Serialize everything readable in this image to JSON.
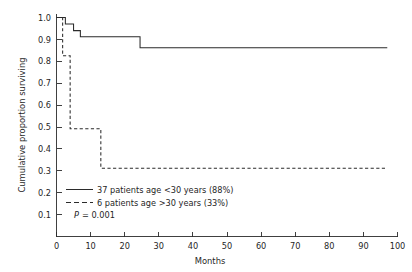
{
  "chart_data": {
    "type": "line",
    "subtype": "kaplan-meier-step",
    "title": "",
    "xlabel": "Months",
    "ylabel": "Cumulative proportion surviving",
    "xlim": [
      0,
      100
    ],
    "ylim": [
      0,
      1.0
    ],
    "grid": false,
    "legend_position": "inside lower-left",
    "x_ticks": [
      0,
      10,
      20,
      30,
      40,
      50,
      60,
      70,
      80,
      90,
      100
    ],
    "x_tick_labels": [
      "0",
      "10",
      "20",
      "30",
      "40",
      "50",
      "60",
      "70",
      "80",
      "90",
      "100"
    ],
    "y_ticks": [
      0.1,
      0.2,
      0.3,
      0.4,
      0.5,
      0.6,
      0.7,
      0.8,
      0.9,
      1.0
    ],
    "y_tick_labels": [
      "0.1",
      "0.2",
      "0.3",
      "0.4",
      "0.5",
      "0.6",
      "0.7",
      "0.8",
      "0.9",
      "1.0"
    ],
    "annotations": [
      "P = 0.001"
    ],
    "series": [
      {
        "name": "37 patients age <30 years (88%)",
        "style": "solid",
        "color": "#2b2b2b",
        "n": 37,
        "final_survival": 0.88,
        "x": [
          0,
          2.6,
          2.6,
          5.0,
          5.0,
          7.0,
          7.0,
          24.5,
          24.5,
          97.0
        ],
        "y": [
          1.0,
          1.0,
          0.97,
          0.97,
          0.94,
          0.94,
          0.912,
          0.912,
          0.862,
          0.862
        ]
      },
      {
        "name": "6 patients age >30 years (33%)",
        "style": "dashed",
        "color": "#2b2b2b",
        "n": 6,
        "final_survival": 0.33,
        "x": [
          0,
          1.8,
          1.8,
          4.0,
          4.0,
          13.0,
          13.0,
          97.0
        ],
        "y": [
          1.0,
          1.0,
          0.825,
          0.825,
          0.492,
          0.492,
          0.312,
          0.312
        ]
      }
    ]
  },
  "axes": {
    "y_title": "Cumulative proportion surviving",
    "x_title": "Months"
  },
  "legend": {
    "entries": [
      {
        "marker": "solid-line-sample",
        "label": "37 patients age <30 years (88%)"
      },
      {
        "marker": "dashed-line-sample",
        "label": "6 patients age >30 years (33%)"
      }
    ],
    "p_value_symbol": "P",
    "p_value_text": "= 0.001"
  }
}
